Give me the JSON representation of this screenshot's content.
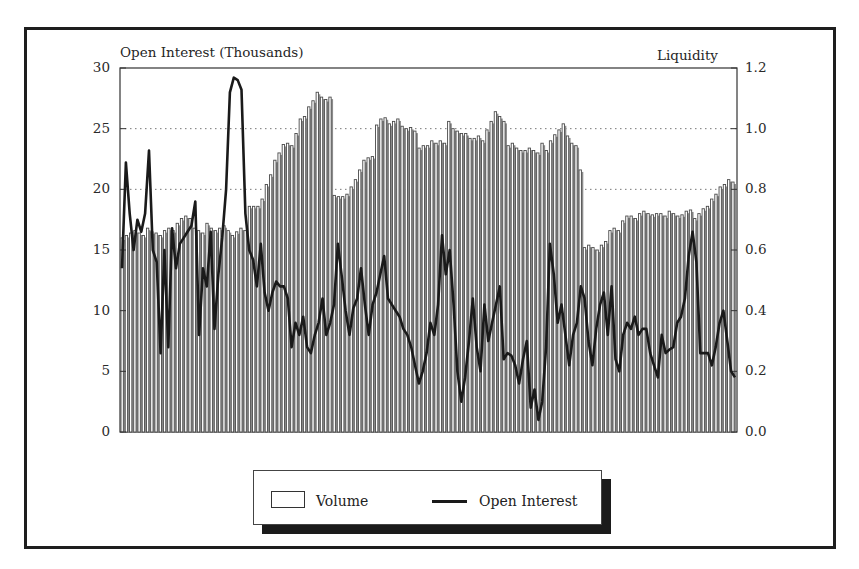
{
  "chart_data": {
    "type": "bar",
    "title": "",
    "left_axis_label": "Open Interest (Thousands)",
    "right_axis_label": "Liquidity",
    "left_ticks": [
      "0",
      "5",
      "10",
      "15",
      "20",
      "25",
      "30"
    ],
    "right_ticks": [
      "0.0",
      "0.2",
      "0.4",
      "0.6",
      "0.8",
      "1.0",
      "1.2"
    ],
    "ylim_left": [
      0,
      30
    ],
    "ylim_right": [
      0,
      1.2
    ],
    "grid": "dotted horizontal at 10, 20, 25",
    "legend_position": "bottom-center",
    "legend": [
      {
        "label": "Volume",
        "style": "open-bar"
      },
      {
        "label": "Open Interest",
        "style": "line"
      }
    ],
    "series": [
      {
        "name": "Volume",
        "type": "bar",
        "axis": "left",
        "values": [
          16.0,
          16.2,
          16.4,
          16.6,
          16.4,
          16.2,
          16.8,
          16.5,
          16.4,
          16.2,
          16.6,
          16.8,
          16.6,
          17.2,
          17.6,
          17.8,
          17.6,
          16.8,
          16.6,
          16.4,
          17.2,
          16.8,
          16.6,
          16.8,
          17.0,
          16.6,
          16.2,
          16.5,
          16.8,
          16.6,
          18.6,
          18.6,
          18.6,
          19.2,
          20.4,
          21.2,
          22.4,
          23.0,
          23.7,
          23.8,
          23.6,
          24.6,
          25.8,
          26.0,
          26.8,
          27.3,
          28.0,
          27.6,
          27.4,
          27.6,
          19.5,
          19.4,
          19.4,
          19.6,
          20.2,
          20.8,
          21.6,
          22.4,
          22.6,
          22.7,
          25.3,
          25.8,
          25.9,
          25.4,
          25.6,
          25.8,
          25.2,
          25.0,
          25.1,
          24.8,
          23.4,
          23.6,
          23.6,
          24.0,
          23.8,
          24.0,
          23.8,
          25.6,
          25.0,
          24.8,
          24.6,
          24.6,
          24.2,
          24.2,
          24.4,
          24.0,
          24.9,
          25.6,
          26.4,
          26.0,
          25.6,
          23.6,
          23.8,
          23.4,
          23.2,
          23.2,
          23.4,
          23.2,
          23.0,
          23.8,
          23.2,
          24.0,
          24.5,
          24.9,
          25.4,
          24.4,
          23.8,
          23.6,
          21.6,
          15.2,
          15.4,
          15.2,
          15.0,
          15.4,
          15.7,
          16.6,
          16.8,
          16.6,
          17.4,
          17.8,
          17.8,
          17.6,
          18.0,
          18.2,
          18.0,
          17.9,
          18.0,
          18.0,
          17.8,
          18.2,
          18.0,
          17.8,
          17.9,
          18.2,
          18.3,
          17.6,
          18.0,
          18.4,
          18.6,
          19.2,
          19.6,
          20.2,
          20.4,
          20.8,
          20.6
        ],
        "color": "#ffffff"
      },
      {
        "name": "Open Interest",
        "type": "line",
        "axis": "left",
        "values": [
          13.5,
          22.2,
          18.0,
          15.0,
          17.5,
          16.5,
          18.0,
          23.2,
          15.0,
          14.0,
          6.5,
          15.0,
          7.0,
          16.8,
          13.5,
          15.5,
          16.0,
          16.5,
          17.0,
          19.0,
          8.0,
          13.5,
          12.0,
          16.5,
          8.5,
          13.0,
          16.0,
          20.0,
          28.0,
          29.2,
          29.0,
          28.2,
          18.0,
          15.0,
          14.2,
          12.0,
          15.5,
          11.5,
          10.0,
          11.5,
          12.4,
          12.0,
          12.0,
          11.0,
          7.0,
          9.0,
          8.0,
          9.5,
          7.0,
          6.5,
          8.0,
          9.0,
          11.0,
          8.0,
          9.0,
          10.5,
          15.5,
          12.8,
          10.0,
          8.0,
          10.2,
          11.0,
          13.5,
          10.5,
          8.0,
          10.5,
          11.5,
          13.0,
          14.5,
          11.0,
          10.5,
          10.0,
          9.5,
          8.5,
          8.0,
          7.0,
          5.5,
          4.0,
          5.0,
          6.5,
          9.0,
          8.0,
          10.5,
          16.2,
          13.0,
          15.0,
          10.5,
          5.0,
          2.5,
          4.5,
          7.5,
          11.0,
          7.0,
          5.0,
          10.5,
          7.5,
          9.0,
          10.5,
          12.0,
          6.0,
          6.5,
          6.3,
          5.5,
          4.0,
          6.0,
          7.5,
          2.0,
          3.5,
          1.0,
          2.5,
          7.0,
          15.5,
          13.0,
          9.0,
          10.5,
          8.0,
          5.5,
          8.0,
          9.0,
          12.0,
          11.0,
          7.5,
          5.5,
          8.5,
          10.5,
          11.5,
          8.0,
          12.0,
          6.0,
          5.0,
          8.0,
          9.0,
          8.5,
          9.5,
          8.0,
          8.5,
          8.5,
          6.5,
          5.5,
          4.5,
          8.0,
          6.5,
          6.8,
          7.0,
          9.0,
          9.5,
          11.0,
          14.5,
          16.5,
          14.0,
          6.5,
          6.5,
          6.5,
          5.5,
          7.0,
          9.0,
          10.0,
          7.5,
          5.0,
          4.5
        ]
      }
    ],
    "colors": {
      "bar_fill": "#ffffff",
      "bar_stroke": "#4a4a4a",
      "bar_gap_fill": "#8c8c8c",
      "line": "#1a1a1a",
      "grid": "#777777"
    }
  }
}
